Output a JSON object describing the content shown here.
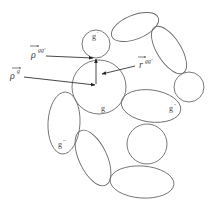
{
  "diagram": {
    "type": "cluster-of-particles-schematic",
    "colors": {
      "stroke": "#6a6a6a",
      "arrow": "#333333",
      "text": "#444444",
      "background": "#ffffff"
    },
    "vectors": [
      {
        "id": "rho_g",
        "base": "ρ",
        "sup": "g",
        "overline_arrow": true
      },
      {
        "id": "rho_gg",
        "base": "ρ",
        "sup": "gg'",
        "overline_arrow": true
      },
      {
        "id": "r_gg",
        "base": "r",
        "sup": "gg'",
        "overline_arrow": true
      }
    ],
    "particle_labels": {
      "g": {
        "base": "g",
        "sup": ""
      },
      "g_prime": {
        "base": "g",
        "sup": "'"
      },
      "g_double": {
        "base": "g",
        "sup": "''"
      },
      "g_triple": {
        "base": "g",
        "sup": "'''"
      }
    }
  }
}
